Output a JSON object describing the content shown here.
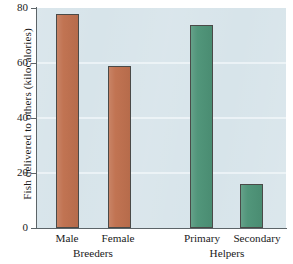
{
  "chart_data": {
    "type": "bar",
    "title": "",
    "xlabel": "",
    "ylabel": "Fish delivered to others (kilocalories)",
    "categories": [
      "Male",
      "Female",
      "Primary",
      "Secondary"
    ],
    "values": [
      78,
      59,
      74,
      16
    ],
    "groups": [
      {
        "label": "Breeders",
        "categories": [
          "Male",
          "Female"
        ],
        "color": "#c0714f"
      },
      {
        "label": "Helpers",
        "categories": [
          "Primary",
          "Secondary"
        ],
        "color": "#4e9478"
      }
    ],
    "bar_colors": [
      "#c0714f",
      "#c0714f",
      "#4e9478",
      "#4e9478"
    ],
    "ylim": [
      0,
      80
    ],
    "yticks": [
      0,
      20,
      40,
      60,
      80
    ],
    "ytick_labels": [
      "0",
      "20",
      "40",
      "60",
      "80"
    ],
    "grid": true,
    "legend": "none",
    "plot_background": "#d7e4ea",
    "axis_color": "#5c6468",
    "bar_edge_color": "#4a4a48"
  },
  "axis": {
    "y_title": "Fish delivered to others (kilocalories)",
    "ticks": [
      {
        "value": "80"
      },
      {
        "value": "60"
      },
      {
        "value": "40"
      },
      {
        "value": "20"
      },
      {
        "value": "0"
      }
    ]
  },
  "bars": [
    {
      "label": "Male",
      "value": 78
    },
    {
      "label": "Female",
      "value": 59
    },
    {
      "label": "Primary",
      "value": 74
    },
    {
      "label": "Secondary",
      "value": 16
    }
  ],
  "groups": [
    {
      "label": "Breeders"
    },
    {
      "label": "Helpers"
    }
  ]
}
